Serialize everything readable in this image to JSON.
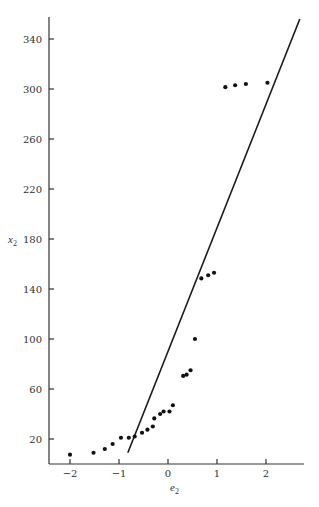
{
  "chart_data": {
    "type": "scatter",
    "title": "",
    "xlabel": "e",
    "xlabel_sub": "2",
    "ylabel": "x",
    "ylabel_sub": "2",
    "xlim": [
      -2.45,
      2.8
    ],
    "ylim": [
      0,
      360
    ],
    "x_ticks": [
      -2,
      -1,
      0,
      1,
      2
    ],
    "x_tick_labels": [
      "−2",
      "−1",
      "0",
      "1",
      "2"
    ],
    "y_ticks": [
      20,
      60,
      100,
      140,
      180,
      220,
      260,
      300,
      340
    ],
    "y_tick_labels": [
      "20",
      "60",
      "100",
      "140",
      "180",
      "220",
      "260",
      "300",
      "340"
    ],
    "grid": false,
    "legend": null,
    "series": [
      {
        "name": "observations",
        "kind": "scatter",
        "x": [
          -2.0,
          -1.52,
          -1.29,
          -1.13,
          -0.96,
          -0.8,
          -0.68,
          -0.53,
          -0.42,
          -0.31,
          -0.28,
          -0.16,
          -0.09,
          0.03,
          0.1,
          0.31,
          0.38,
          0.46,
          0.55,
          0.68,
          0.82,
          0.94,
          1.17,
          1.37,
          1.59,
          2.03
        ],
        "y": [
          7.5,
          9,
          12,
          16,
          21,
          21,
          22,
          25,
          27.5,
          30,
          36.5,
          40,
          42,
          42,
          47,
          70.5,
          71.5,
          75,
          100,
          148.5,
          151,
          153,
          301.5,
          303,
          304,
          305
        ]
      },
      {
        "name": "reference line",
        "kind": "line",
        "x": [
          -0.82,
          2.69
        ],
        "y": [
          9,
          356
        ]
      }
    ]
  },
  "layout": {
    "plot_left": 49,
    "plot_right": 304,
    "plot_top": 17,
    "x_axis_y": 464,
    "px_per_x_unit": 49,
    "x_zero_px": 168,
    "px_per_y_unit": 1.25,
    "y300_px": 89
  }
}
